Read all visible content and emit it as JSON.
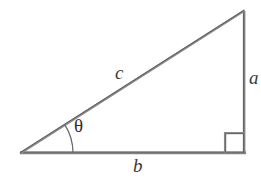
{
  "figure": {
    "background_color": "#ffffff",
    "line_color": "#7d7d7d",
    "line_color_dark": "#5a5a5a",
    "text_color": "#3a3a3a",
    "width": 261,
    "height": 180
  },
  "geometry": {
    "vertices": {
      "left": {
        "x": 20,
        "y": 153
      },
      "bottom_right": {
        "x": 245,
        "y": 153
      },
      "top_right": {
        "x": 245,
        "y": 11
      }
    },
    "sides": {
      "base": {
        "label": "b",
        "from": "left",
        "to": "bottom_right"
      },
      "vertical": {
        "label": "a",
        "from": "bottom_right",
        "to": "top_right"
      },
      "hypotenuse": {
        "label": "c",
        "from": "left",
        "to": "top_right"
      }
    },
    "right_angle_marker": {
      "x": 225,
      "y": 133,
      "size": 20
    },
    "angle_arc": {
      "center_x": 20,
      "center_y": 153,
      "radius": 53
    }
  },
  "labels": {
    "hypotenuse": "c",
    "opposite": "a",
    "adjacent": "b",
    "angle": "θ"
  }
}
